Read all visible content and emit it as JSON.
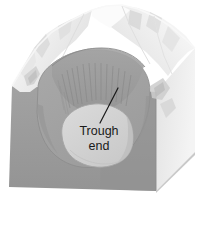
{
  "figure": {
    "kind": "geologic-block-diagram",
    "background_color": "#ffffff"
  },
  "labels": {
    "trough_end": {
      "line1": "Trough",
      "line2": "end"
    }
  },
  "annotations": {
    "leader_line": {
      "name": "trough-end-leader-line",
      "color": "#1a1a1a",
      "from_x": 118,
      "from_y": 88,
      "to_x": 100,
      "to_y": 123
    }
  },
  "colors": {
    "front_face": "#9a9a9a",
    "front_face_shadow": "#8e8e8e",
    "right_face": "#e8e8e8",
    "right_face_edge": "#dcdcdc",
    "cirque_basin": "#a6a6a6",
    "cirque_headwall": "#9d9d9d",
    "trough_floor": "#d2d2d2",
    "upland_light": "#f2f2f2",
    "upland_mid": "#e2e2e2",
    "upland_shadow": "#cfcfcf",
    "ridge_highlight": "#fafafa",
    "striation": "#8a8a8a",
    "outline": "#7d7d7d",
    "text": "#1a1a1a"
  },
  "geometry": {
    "block_top_left_x": 12,
    "block_top_left_y": 86,
    "block_bottom_left_x": 9,
    "block_bottom_left_y": 187,
    "block_front_right_x": 156,
    "block_front_right_y": 191,
    "block_back_right_x": 195,
    "block_back_right_y": 152
  },
  "features": [
    {
      "name": "arete-ridge-crest",
      "description": "jagged ridge crest along the upper skyline"
    },
    {
      "name": "cirque-headwall",
      "description": "steep striated back wall of the cirque"
    },
    {
      "name": "cirque-basin-floor",
      "description": "rounded floor of the cirque basin"
    },
    {
      "name": "trough-end-lobe",
      "description": "rock lip marking the end of the glacial trough"
    },
    {
      "name": "block-front-face",
      "description": "cutaway front face of the block"
    },
    {
      "name": "block-right-face",
      "description": "cutaway right face of the block"
    }
  ]
}
